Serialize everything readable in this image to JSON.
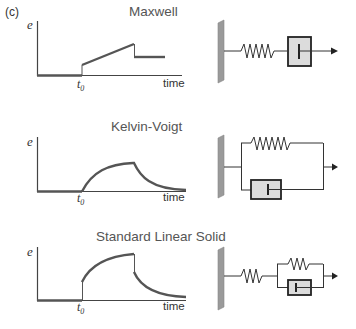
{
  "figure": {
    "panel_label": "(c)",
    "rows": [
      {
        "title": "Maxwell",
        "y_label": "e",
        "x_label": "time",
        "t_label": "t",
        "t_sub": "0",
        "model": "spring-dashpot-series"
      },
      {
        "title": "Kelvin-Voigt",
        "y_label": "e",
        "x_label": "time",
        "t_label": "t",
        "t_sub": "0",
        "model": "spring-dashpot-parallel"
      },
      {
        "title": "Standard Linear Solid",
        "y_label": "e",
        "x_label": "time",
        "t_label": "t",
        "t_sub": "0",
        "model": "spring-series-with-parallel-spring-dashpot"
      }
    ],
    "colors": {
      "curve": "#555555",
      "axis": "#444444",
      "wall": "#9a9a9a",
      "dashpot_fill": "#dcdcdc",
      "line": "#333333"
    }
  }
}
